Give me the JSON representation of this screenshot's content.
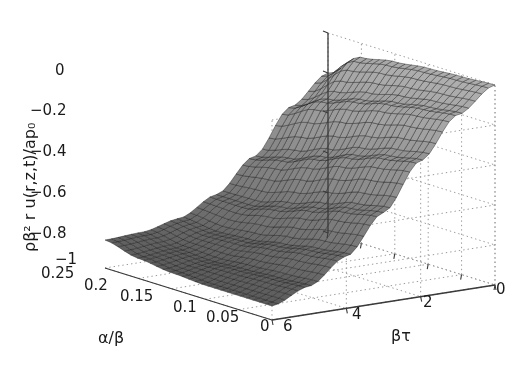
{
  "figure": {
    "type": "surface-plot-3d",
    "background_color": "#ffffff",
    "surface_colors": {
      "dark": "#1d1d1d",
      "mid": "#6e6e6e",
      "light": "#b4b4b4",
      "mesh_line": "#222222"
    },
    "grid_color": "#9a9a9a",
    "axis_color": "#3a3a3a"
  },
  "axes": {
    "y": {
      "label": "ρβ² r u(r,z,t)/ap₀",
      "ticks": [
        "0",
        "−0.2",
        "−0.4",
        "−0.6",
        "−0.8",
        "−1"
      ],
      "range": [
        -1,
        0
      ]
    },
    "x": {
      "label": "α/β",
      "ticks": [
        "0.25",
        "0.2",
        "0.15",
        "0.1",
        "0.05",
        "0"
      ],
      "range": [
        0,
        0.25
      ]
    },
    "z": {
      "label": "βτ",
      "ticks": [
        "6",
        "4",
        "2",
        "0"
      ],
      "range": [
        0,
        6
      ]
    }
  },
  "chart_data": {
    "type": "surface",
    "title": "",
    "xlabel": "α/β",
    "ylabel": "ρβ² r u(r,z,t)/ap₀",
    "zlabel": "βτ",
    "xlim": [
      0,
      0.25
    ],
    "zlim": [
      0,
      6
    ],
    "ylim": [
      -1,
      0
    ],
    "grid": true,
    "legend": "none",
    "x": [
      0,
      0.05,
      0.1,
      0.15,
      0.2,
      0.25
    ],
    "z": [
      0,
      1,
      2,
      3,
      4,
      5,
      6
    ],
    "values": [
      [
        0.0,
        -0.12,
        -0.32,
        -0.55,
        -0.74,
        -0.86,
        -0.93
      ],
      [
        -0.01,
        -0.14,
        -0.35,
        -0.58,
        -0.76,
        -0.87,
        -0.93
      ],
      [
        -0.02,
        -0.17,
        -0.4,
        -0.63,
        -0.79,
        -0.88,
        -0.93
      ],
      [
        -0.04,
        -0.21,
        -0.46,
        -0.68,
        -0.82,
        -0.89,
        -0.92
      ],
      [
        -0.07,
        -0.26,
        -0.52,
        -0.72,
        -0.83,
        -0.88,
        -0.9
      ],
      [
        -0.2,
        -0.34,
        -0.56,
        -0.72,
        -0.81,
        -0.85,
        -0.86
      ]
    ]
  },
  "tick_positions": {
    "y": [
      {
        "label": "0",
        "x": 55,
        "y": 61
      },
      {
        "label": "−0.2",
        "x": 36,
        "y": 101
      },
      {
        "label": "−0.4",
        "x": 36,
        "y": 142
      },
      {
        "label": "−0.6",
        "x": 36,
        "y": 183
      },
      {
        "label": "−0.8",
        "x": 36,
        "y": 224
      },
      {
        "label": "−1",
        "x": 52,
        "y": 256
      }
    ],
    "x": [
      {
        "label": "0.25",
        "x": 43,
        "y": 268
      },
      {
        "label": "0.2",
        "x": 85,
        "y": 280
      },
      {
        "label": "0.15",
        "x": 124,
        "y": 290
      },
      {
        "label": "0.1",
        "x": 176,
        "y": 301
      },
      {
        "label": "0.05",
        "x": 210,
        "y": 311
      },
      {
        "label": "0",
        "x": 262,
        "y": 320
      }
    ],
    "z": [
      {
        "label": "6",
        "x": 284,
        "y": 320
      },
      {
        "label": "4",
        "x": 353,
        "y": 308
      },
      {
        "label": "2",
        "x": 424,
        "y": 296
      },
      {
        "label": "0",
        "x": 497,
        "y": 283
      }
    ]
  },
  "axis_label_positions": {
    "x": {
      "x": 98,
      "y": 330
    },
    "z": {
      "x": 391,
      "y": 328
    },
    "y": {
      "x": 14,
      "y": 248
    }
  }
}
